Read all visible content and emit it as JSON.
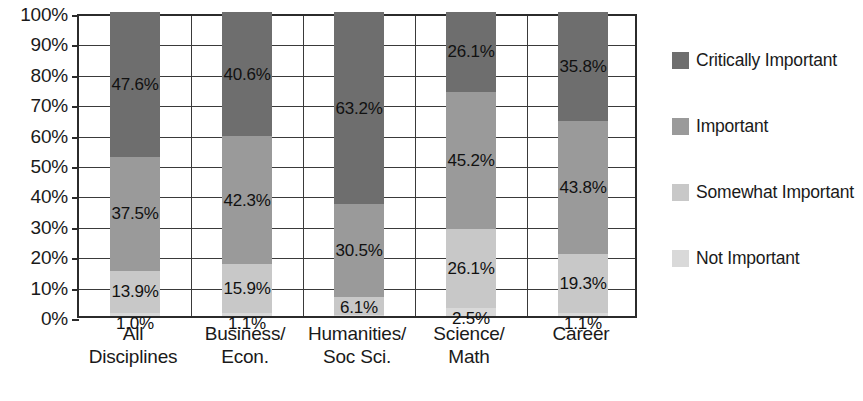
{
  "chart_data": {
    "type": "bar",
    "subtype": "stacked-bar-100-percent",
    "title": "",
    "subtitle": "",
    "xlabel": "",
    "ylabel": "",
    "ylim": [
      0,
      100
    ],
    "y_tick_labels": [
      "100%",
      "90%",
      "80%",
      "70%",
      "60%",
      "50%",
      "40%",
      "30%",
      "20%",
      "10%",
      "0%"
    ],
    "y_tick_values": [
      100,
      90,
      80,
      70,
      60,
      50,
      40,
      30,
      20,
      10,
      0
    ],
    "grid": true,
    "grid_axis": "y",
    "legend_position": "right",
    "categories": [
      "All Disciplines",
      "Business/ Econ.",
      "Humanities/ Soc Sci.",
      "Science/ Math",
      "Career"
    ],
    "category_lines": [
      [
        "All",
        "Disciplines"
      ],
      [
        "Business/",
        "Econ."
      ],
      [
        "Humanities/",
        "Soc Sci."
      ],
      [
        "Science/",
        "Math"
      ],
      [
        "Career",
        ""
      ]
    ],
    "series": [
      {
        "name": "Critically Important",
        "color": "#6e6e6e",
        "values": [
          47.6,
          40.6,
          63.2,
          26.1,
          35.8
        ],
        "labels": [
          "47.6%",
          "40.6%",
          "63.2%",
          "26.1%",
          "35.8%"
        ]
      },
      {
        "name": "Important",
        "color": "#9a9a9a",
        "values": [
          37.5,
          42.3,
          30.5,
          45.2,
          43.8
        ],
        "labels": [
          "37.5%",
          "42.3%",
          "30.5%",
          "45.2%",
          "43.8%"
        ]
      },
      {
        "name": "Somewhat Important",
        "color": "#c8c8c8",
        "values": [
          13.9,
          15.9,
          6.1,
          26.1,
          19.3
        ],
        "labels": [
          "13.9%",
          "15.9%",
          "6.1%",
          "26.1%",
          "19.3%"
        ]
      },
      {
        "name": "Not Important",
        "color": "#d9d9d9",
        "values": [
          1.0,
          1.1,
          0.2,
          2.5,
          1.1
        ],
        "labels": [
          "1.0%",
          "1.1%",
          "",
          "2.5%",
          "1.1%"
        ]
      }
    ]
  },
  "legend": {
    "items": [
      {
        "label": "Critically Important",
        "color": "#6e6e6e"
      },
      {
        "label": "Important",
        "color": "#9a9a9a"
      },
      {
        "label": "Somewhat Important",
        "color": "#c8c8c8"
      },
      {
        "label": "Not Important",
        "color": "#d9d9d9"
      }
    ]
  }
}
